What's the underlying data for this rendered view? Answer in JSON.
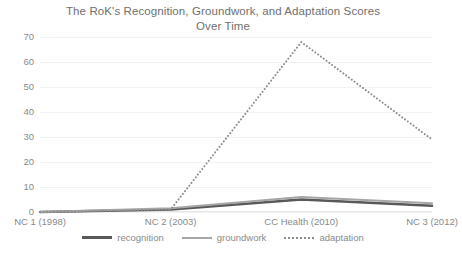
{
  "chart_data": {
    "type": "line",
    "title": "The RoK's Recognition, Groundwork, and Adaptation Scores Over Time",
    "title_line1": "The RoK's Recognition, Groundwork, and Adaptation Scores",
    "title_line2": "Over Time",
    "xlabel": "",
    "ylabel": "",
    "categories": [
      "NC 1 (1998)",
      "NC 2 (2003)",
      "CC Health (2010)",
      "NC 3 (2012)"
    ],
    "ylim": [
      0,
      70
    ],
    "ytick_labels": [
      "70",
      "60",
      "50",
      "40",
      "30",
      "20",
      "10",
      "0"
    ],
    "ytick_values": [
      70,
      60,
      50,
      40,
      30,
      20,
      10,
      0
    ],
    "grid": true,
    "legend_position": "bottom",
    "series": [
      {
        "name": "recognition",
        "values": [
          0,
          1,
          5,
          2.5
        ],
        "color": "#595959",
        "style": "solid"
      },
      {
        "name": "groundwork",
        "values": [
          0,
          1.5,
          6,
          3.5
        ],
        "color": "#a6a6a6",
        "style": "solid"
      },
      {
        "name": "adaptation",
        "values": [
          0,
          1,
          68,
          29
        ],
        "color": "#8c8c8c",
        "style": "dotted"
      }
    ]
  }
}
